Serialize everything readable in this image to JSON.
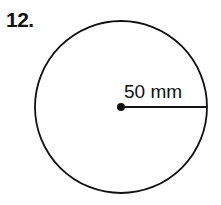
{
  "problem": {
    "number": "12.",
    "shape": "circle",
    "measurement_label": "50 mm",
    "measurement_type": "radius"
  },
  "colors": {
    "stroke": "#111111",
    "background": "#ffffff"
  }
}
